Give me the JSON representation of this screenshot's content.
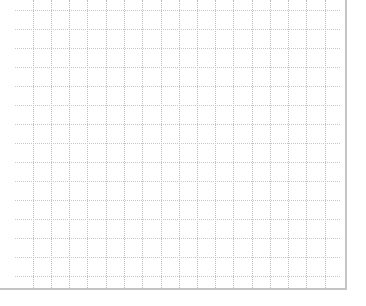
{
  "grid": {
    "line_color": "#bdbdbd",
    "border_color": "#c4c4c4",
    "background": "#ffffff",
    "columns_x": [
      33,
      51,
      69,
      87,
      106,
      124,
      142,
      161,
      179,
      197,
      215,
      233,
      252,
      270,
      288,
      306,
      325
    ],
    "rows_y": [
      10,
      29,
      48,
      67,
      86,
      105,
      124,
      143,
      162,
      181,
      200,
      219,
      238,
      257,
      276
    ]
  }
}
